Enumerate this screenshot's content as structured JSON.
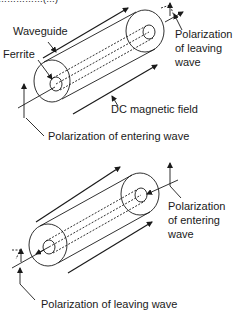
{
  "caption_fragment": "……………(…)",
  "top_diagram": {
    "labels": {
      "waveguide": "Waveguide",
      "ferrite": "Ferrite",
      "polarization_leaving_line1": "Polarization",
      "polarization_leaving_line2": "of leaving",
      "polarization_leaving_line3": "wave",
      "dc_field": "DC magnetic field",
      "polarization_entering": "Polarization of entering wave"
    }
  },
  "bottom_diagram": {
    "labels": {
      "polarization_entering_line1": "Polarization",
      "polarization_entering_line2": "of entering",
      "polarization_entering_line3": "wave",
      "polarization_leaving": "Polarization of leaving wave"
    }
  },
  "colors": {
    "ink": "#1a1a1a",
    "background": "#ffffff"
  }
}
